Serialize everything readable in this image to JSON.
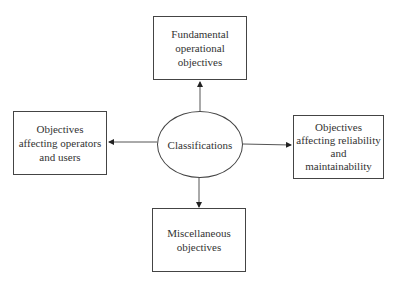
{
  "diagram": {
    "center": {
      "label": "Classifications"
    },
    "nodes": {
      "top": {
        "label": "Fundamental\noperational\nobjectives"
      },
      "left": {
        "label": "Objectives\naffecting operators\nand users"
      },
      "right": {
        "label": "Objectives\naffecting reliability\nand\nmaintainability"
      },
      "bottom": {
        "label": "Miscellaneous\nobjectives"
      }
    },
    "edges": [
      {
        "from": "Classifications",
        "to": "Fundamental operational objectives"
      },
      {
        "from": "Classifications",
        "to": "Objectives affecting operators and users"
      },
      {
        "from": "Classifications",
        "to": "Objectives affecting reliability and maintainability"
      },
      {
        "from": "Classifications",
        "to": "Miscellaneous objectives"
      }
    ]
  }
}
